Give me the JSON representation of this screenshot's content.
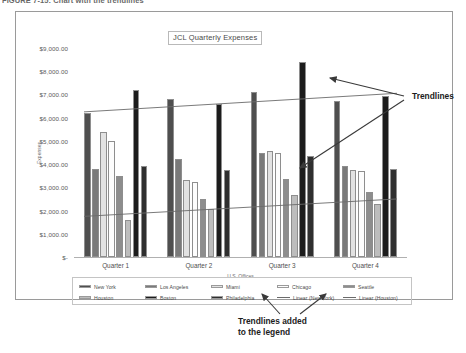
{
  "figure_caption": "FIGURE 7-15: Chart with the trendlines",
  "chart": {
    "title": "JCL Quarterly Expenses",
    "x_axis_title": "U.S. Offices",
    "y_axis_title": "Expenses"
  },
  "annotations": {
    "trendlines": "Trendlines",
    "legend_note_line1": "Trendlines added",
    "legend_note_line2": "to the legend"
  },
  "legend": {
    "row1": [
      {
        "label": "New York",
        "color": "#4f4f4f",
        "kind": "swatch"
      },
      {
        "label": "Los Angeles",
        "color": "#7a7a7a",
        "kind": "swatch"
      },
      {
        "label": "Miami",
        "color": "#e2e2e2",
        "kind": "swatch"
      },
      {
        "label": "Chicago",
        "color": "#fdfdfd",
        "kind": "swatch"
      },
      {
        "label": "Seattle",
        "color": "#8d8d8d",
        "kind": "swatch"
      }
    ],
    "row2": [
      {
        "label": "Houston",
        "color": "#bdbdbd",
        "kind": "swatch"
      },
      {
        "label": "Boston",
        "color": "#1c1c1c",
        "kind": "swatch"
      },
      {
        "label": "Philadelphia",
        "color": "#2f2f2f",
        "kind": "swatch"
      },
      {
        "label": "Linear (New York)",
        "color": "#6b6b6b",
        "kind": "line"
      },
      {
        "label": "Linear (Houston)",
        "color": "#6b6b6b",
        "kind": "line"
      }
    ]
  },
  "chart_data": {
    "type": "bar",
    "title": "JCL Quarterly Expenses",
    "xlabel": "U.S. Offices",
    "ylabel": "Expenses",
    "categories": [
      "Quarter 1",
      "Quarter 2",
      "Quarter 3",
      "Quarter 4"
    ],
    "ylim": [
      0,
      9000
    ],
    "ytick_values": [
      0,
      1000,
      2000,
      3000,
      4000,
      5000,
      6000,
      7000,
      8000,
      9000
    ],
    "ytick_labels": [
      "$-",
      "$1,000.00",
      "$2,000.00",
      "$3,000.00",
      "$4,000.00",
      "$5,000.00",
      "$6,000.00",
      "$7,000.00",
      "$8,000.00",
      "$9,000.00"
    ],
    "grid": false,
    "legend_position": "bottom",
    "series": [
      {
        "name": "New York",
        "color": "#4f4f4f",
        "values": [
          6200,
          6800,
          7100,
          6700
        ]
      },
      {
        "name": "Los Angeles",
        "color": "#7a7a7a",
        "values": [
          3800,
          4200,
          4500,
          3900
        ]
      },
      {
        "name": "Miami",
        "color": "#e2e2e2",
        "values": [
          5400,
          3300,
          4550,
          3750
        ]
      },
      {
        "name": "Chicago",
        "color": "#fdfdfd",
        "values": [
          5000,
          3250,
          4500,
          3700
        ]
      },
      {
        "name": "Seattle",
        "color": "#8d8d8d",
        "values": [
          3500,
          2500,
          3350,
          2800
        ]
      },
      {
        "name": "Houston",
        "color": "#bdbdbd",
        "values": [
          1600,
          2050,
          2650,
          2300
        ]
      },
      {
        "name": "Boston",
        "color": "#1c1c1c",
        "values": [
          7200,
          6600,
          8400,
          6950
        ]
      },
      {
        "name": "Philadelphia",
        "color": "#2f2f2f",
        "values": [
          3900,
          3750,
          4350,
          3800
        ]
      }
    ],
    "trendlines": [
      {
        "name": "Linear (New York)",
        "color": "#6b6b6b",
        "start": 6250,
        "end": 7050
      },
      {
        "name": "Linear (Houston)",
        "color": "#6b6b6b",
        "start": 1750,
        "end": 2500
      }
    ]
  }
}
